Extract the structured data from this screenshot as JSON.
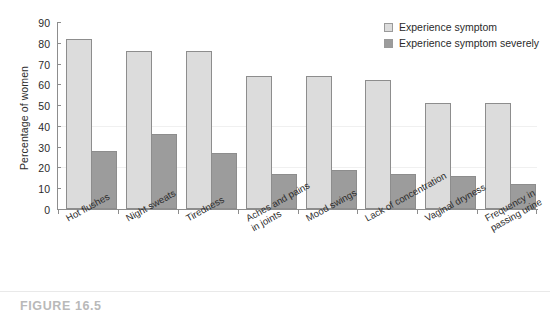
{
  "caption": "FIGURE 16.5",
  "legend": {
    "position": "top-right",
    "items": [
      {
        "label": "Experience symptom",
        "color": "#dcdcdc",
        "swatch": "light"
      },
      {
        "label": "Experience symptom severely",
        "color": "#9c9c9c",
        "swatch": "dark"
      }
    ]
  },
  "chart_data": {
    "type": "bar",
    "title": "",
    "xlabel": "",
    "ylabel": "Percentage of women",
    "ylim": [
      0,
      90
    ],
    "yticks": [
      0,
      10,
      20,
      30,
      40,
      50,
      60,
      70,
      80,
      90
    ],
    "grid": false,
    "legend_position": "top-right",
    "categories": [
      "Hot flushes",
      "Night sweats",
      "Tiredness",
      "Aches and pains\nin joints",
      "Mood swings",
      "Lack of concentration",
      "Vaginal dryness",
      "Frequency in\npassing urine"
    ],
    "category_lines": [
      [
        "Hot flushes"
      ],
      [
        "Night sweats"
      ],
      [
        "Tiredness"
      ],
      [
        "Aches and pains",
        "in joints"
      ],
      [
        "Mood swings"
      ],
      [
        "Lack of concentration"
      ],
      [
        "Vaginal dryness"
      ],
      [
        "Frequency in",
        "passing urine"
      ]
    ],
    "series": [
      {
        "name": "Experience symptom",
        "color": "#dcdcdc",
        "values": [
          82,
          76,
          76,
          64,
          64,
          62,
          51,
          51
        ]
      },
      {
        "name": "Experience symptom severely",
        "color": "#9c9c9c",
        "values": [
          28,
          36,
          27,
          17,
          19,
          17,
          16,
          12
        ]
      }
    ]
  }
}
